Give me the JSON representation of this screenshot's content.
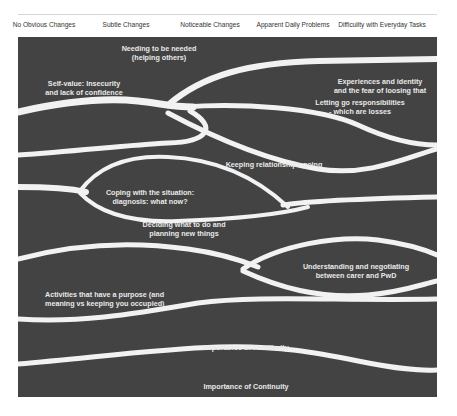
{
  "header": {
    "stages": [
      {
        "label": "No Obvious Changes",
        "x": 44
      },
      {
        "label": "Subtle Changes",
        "x": 126
      },
      {
        "label": "Noticeable Changes",
        "x": 210
      },
      {
        "label": "Apparent Daily Problems",
        "x": 293
      },
      {
        "label": "Difficulity with Everyday Tasks",
        "x": 374
      }
    ]
  },
  "colors": {
    "panel": "#434343",
    "stream": "#f2f2f2",
    "text": "#e9e9e9",
    "header_text": "#333333"
  },
  "themes": [
    {
      "id": "needing",
      "line1": "Needing to be needed",
      "line2": "(helping others)"
    },
    {
      "id": "experiences",
      "line1": "Experiences and identity",
      "line2": "and the fear of loosing that"
    },
    {
      "id": "self_value",
      "line1": "Self-value: Insecurity",
      "line2": "and lack of confidence"
    },
    {
      "id": "letting_go",
      "line1": "Letting go responsibilities",
      "line2": "- which are losses"
    },
    {
      "id": "relationships",
      "line1": "Keeping relationships going",
      "line2": ""
    },
    {
      "id": "coping",
      "line1": "Coping with the situation:",
      "line2": "diagnosis: what now?"
    },
    {
      "id": "deciding",
      "line1": "Deciding what to do and",
      "line2": "planning new things"
    },
    {
      "id": "understanding",
      "line1": "Understanding and negotiating",
      "line2": "between carer and PwD"
    },
    {
      "id": "activities",
      "line1": "Activities that have a purpose (and",
      "line2": "meaning vs keeping you occupied)"
    },
    {
      "id": "familiarity",
      "line1": "Importance of Familiarity",
      "line2": ""
    },
    {
      "id": "continuity",
      "line1": "Importance of Continuity",
      "line2": ""
    }
  ]
}
